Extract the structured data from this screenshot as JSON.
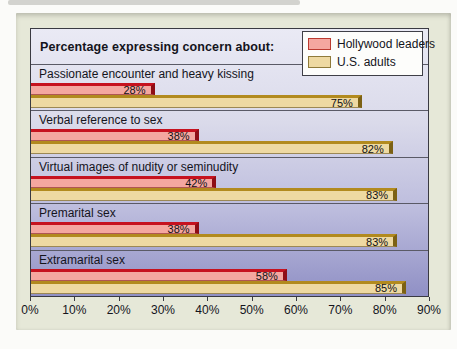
{
  "header": {
    "title": "Percentage expressing concern about:"
  },
  "legend": {
    "items": [
      {
        "label": "Hollywood leaders",
        "color": "#f4a7a0",
        "border": "#bb3a30"
      },
      {
        "label": "U.S. adults",
        "color": "#eed9a2",
        "border": "#8f7a3a"
      }
    ]
  },
  "chart_data": {
    "type": "bar",
    "orientation": "horizontal",
    "title": "Percentage expressing concern about:",
    "categories": [
      "Passionate encounter and heavy kissing",
      "Verbal reference to sex",
      "Virtual images of nudity or seminudity",
      "Premarital sex",
      "Extramarital sex"
    ],
    "series": [
      {
        "name": "Hollywood leaders",
        "values": [
          28,
          38,
          42,
          38,
          58
        ],
        "color": "#f4a7a0"
      },
      {
        "name": "U.S. adults",
        "values": [
          75,
          82,
          83,
          83,
          85
        ],
        "color": "#eed9a2"
      }
    ],
    "value_label_suffix": "%",
    "xlim": [
      0,
      90
    ],
    "x_ticks": [
      "0%",
      "10%",
      "20%",
      "30%",
      "40%",
      "50%",
      "60%",
      "70%",
      "80%",
      "90%"
    ],
    "grid": "horizontal row separators",
    "legend_position": "top-right",
    "plot_background": "vertical lavender gradient #eaeaf5 to #9090c5"
  },
  "colors": {
    "card_bg": "#e6e8d8",
    "plot_border": "#3a3a42",
    "separator": "#5a5a66",
    "series1_fill": "#f4a7a0",
    "series1_edge": "#c6121f",
    "series1_side": "#8e0e16",
    "series2_fill": "#eed9a2",
    "series2_edge": "#b28a1e",
    "series2_side": "#7c6114",
    "text": "#14141c"
  }
}
